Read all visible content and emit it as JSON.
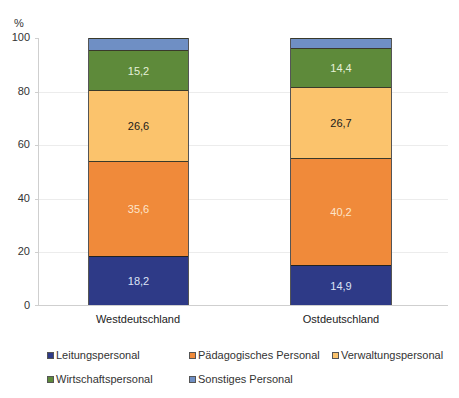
{
  "chart_data": {
    "type": "bar",
    "stacked": true,
    "title": "",
    "xlabel": "",
    "ylabel": "%",
    "ylim": [
      0,
      100
    ],
    "yticks": [
      "0",
      "20",
      "40",
      "60",
      "80",
      "100"
    ],
    "grid": true,
    "legend_position": "bottom",
    "categories": [
      "Westdeutschland",
      "Ostdeutschland"
    ],
    "series": [
      {
        "name": "Leitungspersonal",
        "color": "#2e3a87",
        "label_color": "#dde3f5",
        "values": [
          18.2,
          14.9
        ],
        "labels": [
          "18,2",
          "14,9"
        ]
      },
      {
        "name": "Pädagogisches Personal",
        "color": "#f08a3a",
        "label_color": "#fde5cc",
        "values": [
          35.6,
          40.2
        ],
        "labels": [
          "35,6",
          "40,2"
        ]
      },
      {
        "name": "Verwaltungspersonal",
        "color": "#fbc36c",
        "label_color": "#1a1a1a",
        "values": [
          26.6,
          26.7
        ],
        "labels": [
          "26,6",
          "26,7"
        ]
      },
      {
        "name": "Wirtschaftspersonal",
        "color": "#5e8a3a",
        "label_color": "#e6f0d8",
        "values": [
          15.2,
          14.4
        ],
        "labels": [
          "15,2",
          "14,4"
        ]
      },
      {
        "name": "Sonstiges Personal",
        "color": "#6f8fc4",
        "label_color": "#ffffff",
        "values": [
          4.4,
          3.8
        ],
        "labels": [
          "",
          ""
        ]
      }
    ]
  },
  "axis": {
    "unit": "%",
    "ticks": [
      "100",
      "80",
      "60",
      "40",
      "20",
      "0"
    ]
  },
  "legend": {
    "items": [
      {
        "label": "Leitungspersonal",
        "color": "#2e3a87"
      },
      {
        "label": "Pädagogisches Personal",
        "color": "#f08a3a"
      },
      {
        "label": "Verwaltungspersonal",
        "color": "#fbc36c"
      },
      {
        "label": "Wirtschaftspersonal",
        "color": "#5e8a3a"
      },
      {
        "label": "Sonstiges Personal",
        "color": "#6f8fc4"
      }
    ]
  }
}
